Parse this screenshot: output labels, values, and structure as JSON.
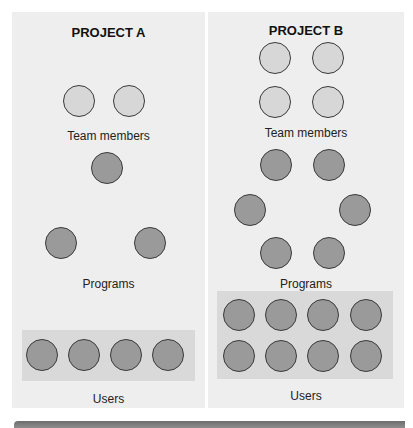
{
  "diagram": {
    "colors": {
      "panel_bg": "#eeeeee",
      "team_member_fill": "#d7d7d7",
      "program_fill": "#9a9a9a",
      "user_fill": "#9a9a9a",
      "users_box_bg": "#d9d9d9",
      "bottom_bar": "#777777"
    },
    "panels": [
      {
        "title": "PROJECT A",
        "team_members_label": "Team members",
        "programs_label": "Programs",
        "users_label": "Users",
        "team_members_count": 2,
        "programs_count": 3,
        "users_count": 4
      },
      {
        "title": "PROJECT B",
        "team_members_label": "Team members",
        "programs_label": "Programs",
        "users_label": "Users",
        "team_members_count": 4,
        "programs_count": 6,
        "users_count": 8
      }
    ]
  }
}
